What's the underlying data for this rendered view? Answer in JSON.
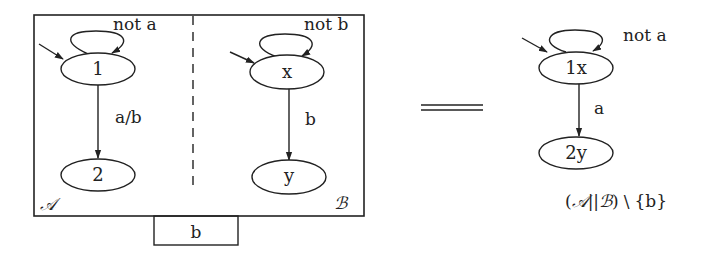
{
  "left_diagram": {
    "automaton_A": {
      "name": "𝒜",
      "states": [
        {
          "id": "1",
          "label": "1",
          "initial": true
        },
        {
          "id": "2",
          "label": "2",
          "initial": false
        }
      ],
      "self_loop_label": "not a",
      "transition_label": "a/b"
    },
    "automaton_B": {
      "name": "ℬ",
      "states": [
        {
          "id": "x",
          "label": "x",
          "initial": true
        },
        {
          "id": "y",
          "label": "y",
          "initial": false
        }
      ],
      "self_loop_label": "not b",
      "transition_label": "b"
    },
    "port_label": "b"
  },
  "equals_symbol": "equals",
  "right_diagram": {
    "states": [
      {
        "id": "1x",
        "label": "1x",
        "initial": true
      },
      {
        "id": "2y",
        "label": "2y",
        "initial": false
      }
    ],
    "self_loop_label": "not a",
    "transition_label": "a",
    "caption": {
      "open": "(",
      "a": "𝒜",
      "par": "||",
      "b": "ℬ",
      "close": ")",
      "setminus": "\\",
      "set": "{b}"
    }
  }
}
